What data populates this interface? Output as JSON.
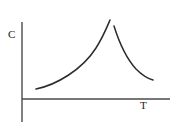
{
  "figure": {
    "width": 178,
    "height": 131,
    "background_color": "#ffffff",
    "ink_color": "#2b2b2b",
    "axis_color": "#4a4a4a"
  },
  "chart_data": {
    "type": "line",
    "title": "",
    "subtitle": "",
    "xlabel": "T",
    "ylabel": "C",
    "grid": false,
    "legend": null,
    "annotations": [],
    "axes": {
      "x_axis": {
        "label": "T",
        "ticks": [],
        "tick_labels": [],
        "start_px": [
          22,
          99
        ],
        "end_px": [
          170,
          99
        ]
      },
      "y_axis": {
        "label": "C",
        "ticks": [],
        "tick_labels": [],
        "start_px": [
          22,
          22
        ],
        "end_px": [
          22,
          122
        ]
      },
      "origin_px": [
        22,
        99
      ]
    },
    "series": [
      {
        "name": "below-transition-branch",
        "path": "M 36 89 C 56 85, 82 70, 96 48 C 103 37, 107 27, 110 20",
        "points": [
          [
            36,
            89
          ],
          [
            48,
            86
          ],
          [
            60,
            81
          ],
          [
            72,
            74
          ],
          [
            84,
            63
          ],
          [
            93,
            51
          ],
          [
            101,
            39
          ],
          [
            106,
            30
          ],
          [
            110,
            20
          ]
        ]
      },
      {
        "name": "above-transition-branch",
        "path": "M 114 26 C 119 42, 126 58, 136 69 C 143 76, 149 79, 153 80",
        "points": [
          [
            114,
            26
          ],
          [
            118,
            38
          ],
          [
            123,
            50
          ],
          [
            129,
            60
          ],
          [
            136,
            69
          ],
          [
            143,
            75
          ],
          [
            148,
            78
          ],
          [
            153,
            80
          ]
        ]
      }
    ],
    "peak": {
      "left_branch_top_px": [
        110,
        20
      ],
      "right_branch_top_px": [
        114,
        26
      ],
      "discontinuous": true
    }
  },
  "labels": {
    "y_axis_label": "C",
    "x_axis_label": "T"
  }
}
